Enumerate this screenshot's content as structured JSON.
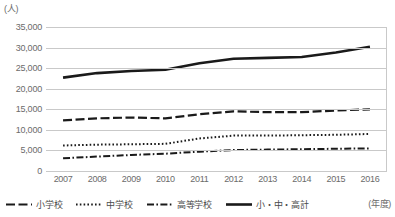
{
  "chart_data": {
    "type": "line",
    "title": "",
    "xlabel": "(年度)",
    "ylabel": "(人)",
    "categories": [
      "2007",
      "2008",
      "2009",
      "2010",
      "2011",
      "2012",
      "2013",
      "2014",
      "2015",
      "2016"
    ],
    "ylim": [
      0,
      35000
    ],
    "ytick_step": 5000,
    "yticks": [
      "0",
      "5,000",
      "10,000",
      "15,000",
      "20,000",
      "25,000",
      "30,000",
      "35,000"
    ],
    "grid": true,
    "legend_position": "bottom",
    "series": [
      {
        "name": "小学校",
        "style": "dashed",
        "color": "#1a1a1a",
        "values": [
          12300,
          12800,
          13000,
          12800,
          13800,
          14500,
          14300,
          14300,
          14700,
          15000
        ]
      },
      {
        "name": "中学校",
        "style": "dotted",
        "color": "#1a1a1a",
        "values": [
          6200,
          6400,
          6500,
          6600,
          7900,
          8600,
          8600,
          8700,
          8800,
          9000
        ]
      },
      {
        "name": "高等学校",
        "style": "dash-dot",
        "color": "#1a1a1a",
        "values": [
          3100,
          3500,
          3900,
          4200,
          4700,
          5100,
          5200,
          5300,
          5400,
          5500
        ]
      },
      {
        "name": "小・中・高計",
        "style": "solid",
        "color": "#1a1a1a",
        "values": [
          22700,
          23800,
          24300,
          24600,
          26200,
          27300,
          27500,
          27700,
          28800,
          30200
        ]
      }
    ]
  },
  "legend": {
    "items": [
      {
        "label": "小学校"
      },
      {
        "label": "中学校"
      },
      {
        "label": "高等学校"
      },
      {
        "label": "小・中・高計"
      }
    ]
  },
  "axes": {
    "y_unit": "(人)",
    "x_unit": "(年度)"
  }
}
